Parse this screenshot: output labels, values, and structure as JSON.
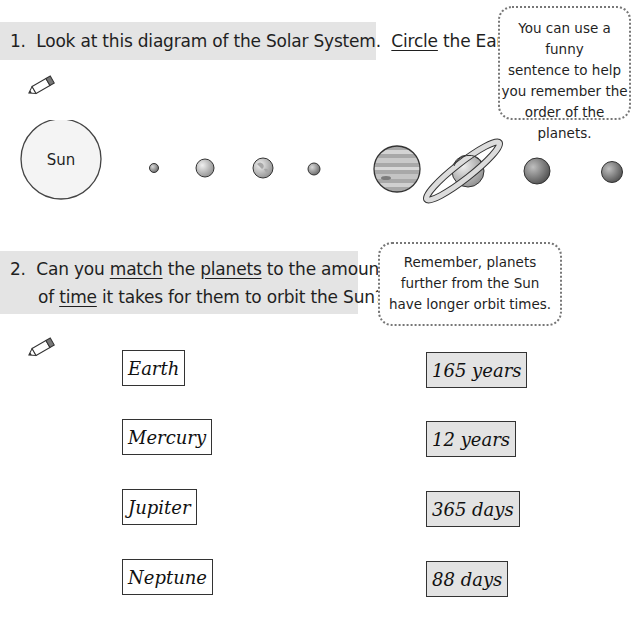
{
  "question1": {
    "number": "1.",
    "text_before": "Look at this diagram of the Solar System.",
    "underlined": "Circle",
    "text_after": "the Earth."
  },
  "tip1": {
    "lines": [
      "You can use a funny",
      "sentence to help",
      "you remember the",
      "order of the planets."
    ]
  },
  "diagram": {
    "sun_label": "Sun",
    "bodies": [
      "sun",
      "mercury",
      "venus",
      "earth",
      "mars",
      "jupiter",
      "saturn",
      "uranus",
      "neptune"
    ]
  },
  "question2": {
    "number": "2.",
    "line1_parts": [
      "Can you ",
      "match",
      " the ",
      "planets",
      " to the amount"
    ],
    "line2_parts": [
      "of ",
      "time",
      " it takes for them to orbit the Sun?"
    ]
  },
  "tip2": {
    "lines": [
      "Remember, planets",
      "further from the Sun",
      "have longer orbit times."
    ]
  },
  "planets": [
    "Earth",
    "Mercury",
    "Jupiter",
    "Neptune"
  ],
  "orbit_times": [
    "165 years",
    "12 years",
    "365 days",
    "88 days"
  ],
  "icons": {
    "pencil": "pencil-icon"
  }
}
